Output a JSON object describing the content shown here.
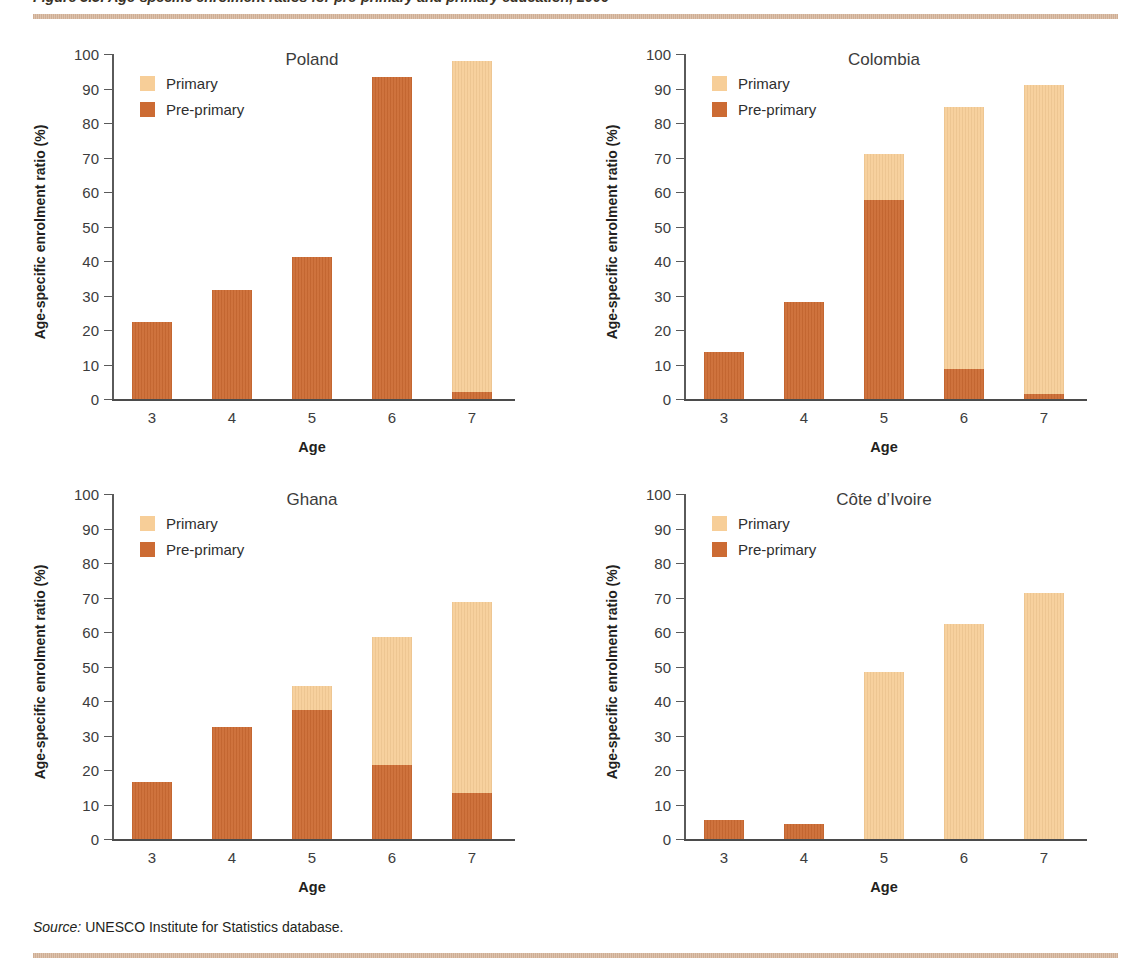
{
  "figure": {
    "caption": "Figure 3.5: Age-specific enrolment ratios for pre-primary and primary education, 2006",
    "source_label": "Source:",
    "source_text": " UNESCO Institute for Statistics database."
  },
  "axes": {
    "y_label": "Age-specific enrolment ratio (%)",
    "x_label": "Age",
    "y_ticks": [
      "0",
      "10",
      "20",
      "30",
      "40",
      "50",
      "60",
      "70",
      "80",
      "90",
      "100"
    ],
    "x_ticks": [
      "3",
      "4",
      "5",
      "6",
      "7"
    ]
  },
  "legend": {
    "primary": "Primary",
    "pre_primary": "Pre-primary"
  },
  "colors": {
    "primary": "#f7ce98",
    "pre_primary": "#cc6b33",
    "rule": "#d8bda6",
    "axis": "#4b4b4b",
    "text": "#231f20"
  },
  "panels": [
    {
      "title": "Poland"
    },
    {
      "title": "Colombia"
    },
    {
      "title": "Ghana"
    },
    {
      "title": "Côte d’Ivoire"
    }
  ],
  "chart_data": [
    {
      "type": "bar",
      "title": "Poland",
      "stacked": true,
      "xlabel": "Age",
      "ylabel": "Age-specific enrolment ratio (%)",
      "ylim": [
        0,
        100
      ],
      "ytick_step": 10,
      "grid": false,
      "legend_position": "upper-left",
      "categories": [
        "3",
        "4",
        "5",
        "6",
        "7"
      ],
      "series": [
        {
          "name": "Pre-primary",
          "color": "#cc6b33",
          "values": [
            22.4,
            31.6,
            41.1,
            93.4,
            2.1
          ]
        },
        {
          "name": "Primary",
          "color": "#f7ce98",
          "values": [
            0,
            0,
            0,
            0,
            95.9
          ]
        }
      ],
      "totals": [
        22.4,
        31.6,
        41.1,
        93.4,
        98.0
      ]
    },
    {
      "type": "bar",
      "title": "Colombia",
      "stacked": true,
      "xlabel": "Age",
      "ylabel": "Age-specific enrolment ratio (%)",
      "ylim": [
        0,
        100
      ],
      "ytick_step": 10,
      "grid": false,
      "legend_position": "upper-left",
      "categories": [
        "3",
        "4",
        "5",
        "6",
        "7"
      ],
      "series": [
        {
          "name": "Pre-primary",
          "color": "#cc6b33",
          "values": [
            13.7,
            28.0,
            57.8,
            8.8,
            1.5
          ]
        },
        {
          "name": "Primary",
          "color": "#f7ce98",
          "values": [
            0,
            0,
            13.2,
            75.9,
            89.5
          ]
        }
      ],
      "totals": [
        13.7,
        28.0,
        71.0,
        84.7,
        91.0
      ]
    },
    {
      "type": "bar",
      "title": "Ghana",
      "stacked": true,
      "xlabel": "Age",
      "ylabel": "Age-specific enrolment ratio (%)",
      "ylim": [
        0,
        100
      ],
      "ytick_step": 10,
      "grid": false,
      "legend_position": "upper-left",
      "categories": [
        "3",
        "4",
        "5",
        "6",
        "7"
      ],
      "series": [
        {
          "name": "Pre-primary",
          "color": "#cc6b33",
          "values": [
            16.4,
            32.5,
            37.3,
            21.4,
            13.2
          ]
        },
        {
          "name": "Primary",
          "color": "#f7ce98",
          "values": [
            0,
            0,
            7.0,
            37.2,
            55.4
          ]
        }
      ],
      "totals": [
        16.4,
        32.5,
        44.3,
        58.6,
        68.6
      ]
    },
    {
      "type": "bar",
      "title": "Côte d’Ivoire",
      "stacked": true,
      "xlabel": "Age",
      "ylabel": "Age-specific enrolment ratio (%)",
      "ylim": [
        0,
        100
      ],
      "ytick_step": 10,
      "grid": false,
      "legend_position": "upper-left",
      "categories": [
        "3",
        "4",
        "5",
        "6",
        "7"
      ],
      "series": [
        {
          "name": "Pre-primary",
          "color": "#cc6b33",
          "values": [
            5.4,
            4.4,
            0,
            0,
            0
          ]
        },
        {
          "name": "Primary",
          "color": "#f7ce98",
          "values": [
            0,
            0,
            48.3,
            62.4,
            71.2
          ]
        }
      ],
      "totals": [
        5.4,
        4.4,
        48.3,
        62.4,
        71.2
      ]
    }
  ]
}
